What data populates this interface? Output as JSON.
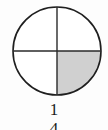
{
  "figure": {
    "type": "fraction-circle-diagram",
    "shape": "circle",
    "total_parts": 4,
    "shaded_parts": 1,
    "shaded_quadrant": "bottom-right",
    "colors": {
      "outline": "#1f1f1f",
      "divider": "#2a2a2a",
      "shaded_fill": "#d0d0d0",
      "unshaded_fill": "#ffffff",
      "background": "#fdfdfd",
      "text": "#1a1a1a"
    },
    "geometry": {
      "center_x": 57,
      "center_y": 51,
      "radius": 44,
      "stroke_width": 1.6,
      "divider_width": 1.4
    }
  },
  "fraction": {
    "numerator": "1",
    "denominator": "4",
    "display": "1/4",
    "value": 0.25
  }
}
